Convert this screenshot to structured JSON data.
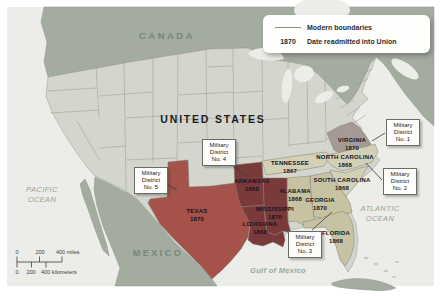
{
  "labels": {
    "canada": "CANADA",
    "united_states": "UNITED STATES",
    "mexico": "MEXICO",
    "pacific_ocean_line1": "PACIFIC",
    "pacific_ocean_line2": "OCEAN",
    "atlantic_ocean_line1": "ATLANTIC",
    "atlantic_ocean_line2": "OCEAN",
    "gulf_of_mexico": "Gulf of Mexico"
  },
  "legend": {
    "modern_boundaries": "Modern boundaries",
    "year_example": "1870",
    "year_description": "Date readmitted into Union"
  },
  "scale_bar": {
    "miles": [
      "0",
      "200",
      "400 miles"
    ],
    "kilometers": [
      "0",
      "200",
      "400 kilometers"
    ]
  },
  "states": [
    {
      "name": "VIRGINIA",
      "year": "1870"
    },
    {
      "name": "TENNESSEE",
      "year": "1867"
    },
    {
      "name": "NORTH CAROLINA",
      "year": "1868"
    },
    {
      "name": "SOUTH CAROLINA",
      "year": "1868"
    },
    {
      "name": "GEORGIA",
      "year": "1870"
    },
    {
      "name": "ALABAMA",
      "year": "1868"
    },
    {
      "name": "FLORIDA",
      "year": "1868"
    },
    {
      "name": "MISSISSIPPI",
      "year": "1870"
    },
    {
      "name": "ARKANSAS",
      "year": "1868"
    },
    {
      "name": "LOUISIANA",
      "year": "1868"
    },
    {
      "name": "TEXAS",
      "year": "1870"
    }
  ],
  "military_districts": [
    {
      "title": "Military District",
      "number": "No. 1"
    },
    {
      "title": "Military District",
      "number": "No. 2"
    },
    {
      "title": "Military District",
      "number": "No. 3"
    },
    {
      "title": "Military District",
      "number": "No. 4"
    },
    {
      "title": "Military District",
      "number": "No. 5"
    }
  ],
  "colors": {
    "water": "#ecede8",
    "canada_mexico_fill": "#a3ac9f",
    "us_default_state_fill": "#d4d6ce",
    "virginia_fill": "#a59b94",
    "tennessee_carolinas_fill": "#d3d0b6",
    "georgia_alabama_florida_fill": "#c6c2a2",
    "arkansas_mississippi_louisiana_fill": "#7b3a3a",
    "texas_fill": "#a4524a",
    "boundary_line": "#98988e",
    "leader_line": "#3a3a3a"
  }
}
